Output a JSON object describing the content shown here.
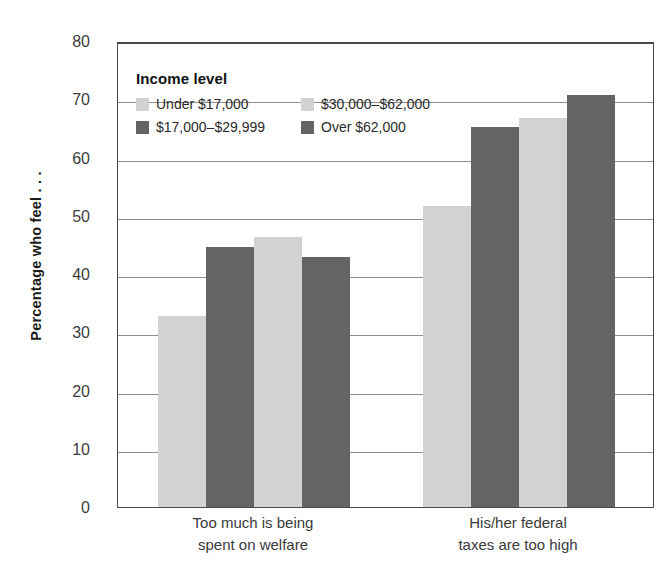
{
  "chart_data": {
    "type": "bar",
    "title": "",
    "xlabel": "",
    "ylabel": "Percentage who feel . . .",
    "ylim": [
      0,
      80
    ],
    "yticks": [
      0,
      10,
      20,
      30,
      40,
      50,
      60,
      70,
      80
    ],
    "grid": true,
    "legend_position": "inside-top-left",
    "legend_title": "Income level",
    "categories": [
      "Too much is being\nspent on welfare",
      "His/her federal\ntaxes are too high"
    ],
    "series": [
      {
        "name": "Under $17,000",
        "color": "#d2d2d2",
        "values": [
          32.8,
          51.6
        ]
      },
      {
        "name": "$17,000–$29,999",
        "color": "#646464",
        "values": [
          44.6,
          65.3
        ]
      },
      {
        "name": "$30,000–$62,000",
        "color": "#d2d2d2",
        "values": [
          46.4,
          66.8
        ]
      },
      {
        "name": "Over $62,000",
        "color": "#646464",
        "values": [
          43.0,
          70.7
        ]
      }
    ]
  },
  "legend": {
    "title": "Income level",
    "rows": [
      [
        {
          "label": "Under $17,000",
          "tone": "light"
        },
        {
          "label": "$30,000–$62,000",
          "tone": "light"
        }
      ],
      [
        {
          "label": "$17,000–$29,999",
          "tone": "dark"
        },
        {
          "label": "Over $62,000",
          "tone": "dark"
        }
      ]
    ]
  },
  "axis": {
    "y_title": "Percentage who feel . . .",
    "y_ticks": [
      "80",
      "70",
      "60",
      "50",
      "40",
      "30",
      "20",
      "10",
      "0"
    ]
  },
  "colors": {
    "light_bar": "#d2d2d2",
    "dark_bar": "#646464",
    "gridline": "#8d8d8d",
    "frame": "#4a4a4a"
  }
}
